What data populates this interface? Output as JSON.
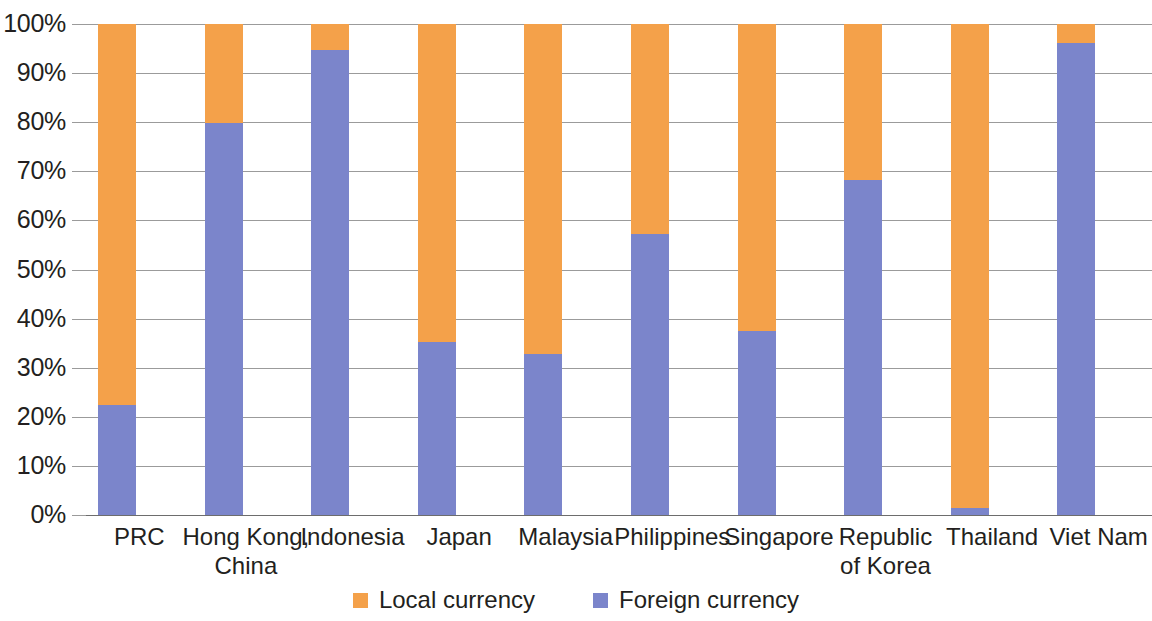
{
  "chart_data": {
    "type": "bar",
    "subtype": "stacked-percentage",
    "title": "",
    "xlabel": "",
    "ylabel": "",
    "ylim": [
      0,
      100
    ],
    "y_tick_labels": [
      "100%",
      "90%",
      "80%",
      "70%",
      "60%",
      "50%",
      "40%",
      "30%",
      "20%",
      "10%",
      "0%"
    ],
    "y_tick_values": [
      100,
      90,
      80,
      70,
      60,
      50,
      40,
      30,
      20,
      10,
      0
    ],
    "grid": true,
    "legend_position": "bottom-center",
    "categories": [
      "PRC",
      "Hong Kong,\nChina",
      "Indonesia",
      "Japan",
      "Malaysia",
      "Philippines",
      "Singapore",
      "Republic\nof Korea",
      "Thailand",
      "Viet Nam"
    ],
    "series": [
      {
        "name": "Local currency",
        "color": "#f4a14a",
        "values": [
          77.5,
          20.2,
          5.3,
          64.8,
          67.2,
          42.8,
          62.5,
          31.8,
          98.6,
          3.9
        ]
      },
      {
        "name": "Foreign currency",
        "color": "#7b85cb",
        "values": [
          22.5,
          79.8,
          94.7,
          35.2,
          32.8,
          57.2,
          37.5,
          68.2,
          1.4,
          96.1
        ]
      }
    ],
    "stack_order": [
      "Foreign currency",
      "Local currency"
    ],
    "legend": [
      {
        "label": "Local currency",
        "color": "#f4a14a",
        "swatch": "square-swatch-orange"
      },
      {
        "label": "Foreign currency",
        "color": "#7b85cb",
        "swatch": "square-swatch-blue"
      }
    ],
    "colors": {
      "local_currency": "#f4a14a",
      "foreign_currency": "#7b85cb",
      "gridline": "#9b9b9b",
      "axis": "#6d6d6d",
      "text": "#231f20",
      "background": "#ffffff"
    }
  }
}
